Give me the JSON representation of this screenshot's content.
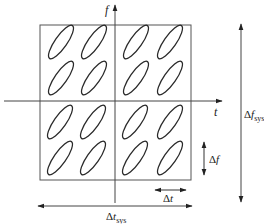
{
  "diagram": {
    "type": "time-frequency lattice",
    "axes": {
      "horizontal_label": "t",
      "vertical_label": "f"
    },
    "grid": {
      "rows": 4,
      "cols": 4,
      "shape": "tilted ellipse"
    },
    "annotations": {
      "delta_f": {
        "prefix": "Δ",
        "symbol": "f"
      },
      "delta_t": {
        "prefix": "Δ",
        "symbol": "t"
      },
      "delta_t_sys": {
        "prefix": "Δ",
        "symbol": "t",
        "subscript": "sys"
      },
      "delta_f_sys": {
        "prefix": "Δ",
        "symbol": "f",
        "subscript": "sys"
      }
    },
    "colors": {
      "stroke": "#2a2a2a",
      "axis": "#444444",
      "background": "#ffffff"
    }
  }
}
